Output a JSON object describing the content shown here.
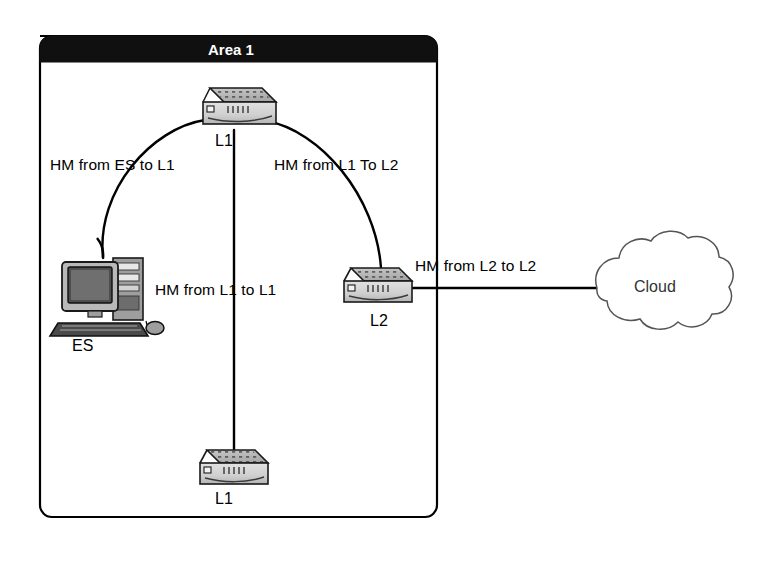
{
  "diagram": {
    "type": "network-topology",
    "background": "#ffffff",
    "area": {
      "title": "Area 1",
      "title_bar_color": "#101010",
      "title_text_color": "#ffffff",
      "border_color": "#000000"
    },
    "nodes": [
      {
        "id": "l1-top",
        "label": "L1",
        "kind": "router",
        "x": 233,
        "y": 110
      },
      {
        "id": "es",
        "label": "ES",
        "kind": "workstation",
        "x": 100,
        "y": 292
      },
      {
        "id": "l2",
        "label": "L2",
        "kind": "router",
        "x": 380,
        "y": 290
      },
      {
        "id": "l1-bottom",
        "label": "L1",
        "kind": "router",
        "x": 233,
        "y": 467
      },
      {
        "id": "cloud",
        "label": "Cloud",
        "kind": "cloud",
        "x": 660,
        "y": 288
      }
    ],
    "links": [
      {
        "id": "es-l1",
        "label": "HM from  ES to L1",
        "from": "es",
        "to": "l1-top",
        "shape": "arc"
      },
      {
        "id": "l1-l2",
        "label": "HM from  L1 To L2",
        "from": "l1-top",
        "to": "l2",
        "shape": "arc"
      },
      {
        "id": "l1-l1",
        "label": "HM from L1 to L1",
        "from": "l1-top",
        "to": "l1-bottom",
        "shape": "straight"
      },
      {
        "id": "l2-cloud",
        "label": "HM from L2 to L2",
        "from": "l2",
        "to": "cloud",
        "shape": "straight"
      }
    ]
  }
}
